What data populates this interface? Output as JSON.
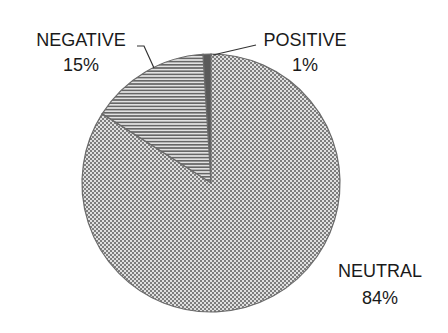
{
  "chart_data": {
    "type": "pie",
    "title": "",
    "categories": [
      "POSITIVE",
      "NEGATIVE",
      "NEUTRAL"
    ],
    "values": [
      1,
      15,
      84
    ],
    "labels": [
      {
        "name": "POSITIVE",
        "pct": "1%"
      },
      {
        "name": "NEGATIVE",
        "pct": "15%"
      },
      {
        "name": "NEUTRAL",
        "pct": "84%"
      }
    ],
    "start_angle_deg": -90,
    "direction": "counterclockwise",
    "legend": "none",
    "data_labels": "outside with leader lines for small slices"
  },
  "colors": {
    "positive": "#5a5a5a",
    "negative_line": "#666666",
    "negative_bg": "#e2e2e2",
    "neutral_dark": "#7d7d7d",
    "neutral_light": "#e0e0e0",
    "outline": "#6a6a6a",
    "text": "#1a1a1a"
  }
}
